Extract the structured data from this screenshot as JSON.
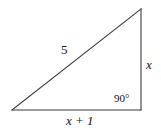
{
  "figure": {
    "type": "right-triangle-diagram",
    "background_color": "#ffffff",
    "stroke_color": "#3b3b3b",
    "text_color": "#111111",
    "labels": {
      "hypotenuse": "5",
      "vertical_side": "x",
      "base_side": "x + 1",
      "right_angle": "90°"
    },
    "geometry": {
      "left_vertex": [
        12,
        110
      ],
      "right_vertex": [
        141,
        110
      ],
      "apex_vertex": [
        141,
        9
      ]
    }
  }
}
